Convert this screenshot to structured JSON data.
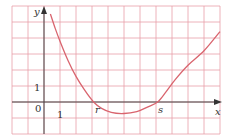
{
  "chart_data": {
    "type": "line",
    "title": "",
    "xlabel": "x",
    "ylabel": "y",
    "origin_label": "0",
    "x_tick_labels": [
      {
        "label": "1",
        "x": 1
      },
      {
        "label": "r",
        "x": 3.1
      },
      {
        "label": "s",
        "x": 7.1
      }
    ],
    "y_tick_labels": [
      {
        "label": "1",
        "y": 1
      }
    ],
    "grid": true,
    "grid_color": "#e8a0a8",
    "curve_color": "#d9646e",
    "axis_color": "#444444",
    "xlim": [
      -2,
      11
    ],
    "ylim": [
      -2,
      6
    ],
    "series": [
      {
        "name": "f(x)",
        "points": [
          [
            0.4,
            5.5
          ],
          [
            0.7,
            4.6
          ],
          [
            1.0,
            3.8
          ],
          [
            1.5,
            2.6
          ],
          [
            2.0,
            1.6
          ],
          [
            2.5,
            0.8
          ],
          [
            3.1,
            0.0
          ],
          [
            3.6,
            -0.4
          ],
          [
            4.2,
            -0.65
          ],
          [
            5.0,
            -0.72
          ],
          [
            5.8,
            -0.6
          ],
          [
            6.5,
            -0.3
          ],
          [
            7.1,
            0.0
          ],
          [
            7.6,
            0.6
          ],
          [
            8.2,
            1.4
          ],
          [
            9.0,
            2.3
          ],
          [
            10.0,
            3.2
          ],
          [
            11.0,
            4.4
          ]
        ]
      }
    ],
    "annotations": {
      "r": "r",
      "s": "s"
    }
  }
}
